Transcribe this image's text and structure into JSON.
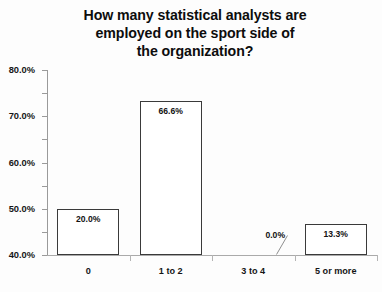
{
  "chart_data": {
    "type": "bar",
    "title": "How many statistical analysts are employed on the sport side of the organization?",
    "title_lines": [
      "How many statistical analysts are",
      "employed on the sport side of",
      "the organization?"
    ],
    "categories": [
      "0",
      "1 to 2",
      "3 to 4",
      "5 or more"
    ],
    "values": [
      20.0,
      66.6,
      0.0,
      13.3
    ],
    "data_labels": [
      "20.0%",
      "66.6%",
      "0.0%",
      "13.3%"
    ],
    "xlabel": "",
    "ylabel": "",
    "ylim": [
      0,
      80
    ],
    "ytick_step": 10,
    "ytick_labels": [
      "0.0%",
      "10.0%",
      "20.0%",
      "30.0%",
      "40.0%",
      "50.0%",
      "60.0%",
      "70.0%",
      "80.0%"
    ],
    "ytick_values": [
      0,
      10,
      20,
      30,
      40,
      50,
      60,
      70,
      80
    ],
    "grid": false,
    "legend": false,
    "bar_fill_color": "#ffffff",
    "bar_border_color": "#3a3a3a",
    "background_color": "#fdfdfd",
    "text_color": "#121212",
    "axis_color": "#9a9a9a"
  }
}
